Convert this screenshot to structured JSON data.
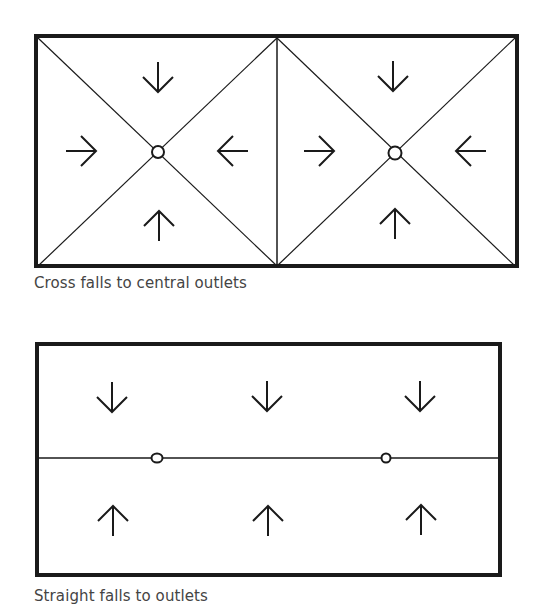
{
  "figures": [
    {
      "caption": "Cross falls to central outlets",
      "bays": [
        {
          "outlet": [
            158,
            152
          ],
          "arrows": [
            "down",
            "right",
            "left",
            "up"
          ]
        },
        {
          "outlet": [
            395,
            153
          ],
          "arrows": [
            "down",
            "right",
            "left",
            "up"
          ]
        }
      ]
    },
    {
      "caption": "Straight falls to outlets",
      "outlets": [
        [
          157,
          458
        ],
        [
          386,
          458
        ]
      ],
      "arrows_top": [
        "down",
        "down",
        "down"
      ],
      "arrows_bottom": [
        "up",
        "up",
        "up"
      ]
    }
  ],
  "colors": {
    "line": "#1a1a1a",
    "text": "#444444",
    "background": "#ffffff"
  }
}
